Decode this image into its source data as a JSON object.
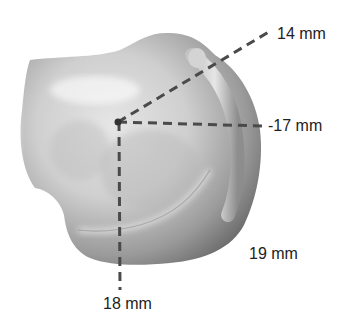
{
  "figure": {
    "type": "anatomical measurement diagram",
    "center_point": {
      "x": 118,
      "y": 122
    },
    "measurements": [
      {
        "id": "upper-right",
        "label": "14 mm",
        "line_to": {
          "x": 272,
          "y": 30
        }
      },
      {
        "id": "right",
        "label": "-17 mm",
        "line_to": {
          "x": 262,
          "y": 126
        }
      },
      {
        "id": "lower-right",
        "label": "19 mm"
      },
      {
        "id": "down",
        "label": "18 mm",
        "line_to": {
          "x": 120,
          "y": 290
        }
      }
    ],
    "colors": {
      "line": "#4a4a4a",
      "text": "#222222",
      "bone_light": "#eeeeee",
      "bone_dark": "#7a7a7a",
      "background": "#ffffff"
    }
  }
}
